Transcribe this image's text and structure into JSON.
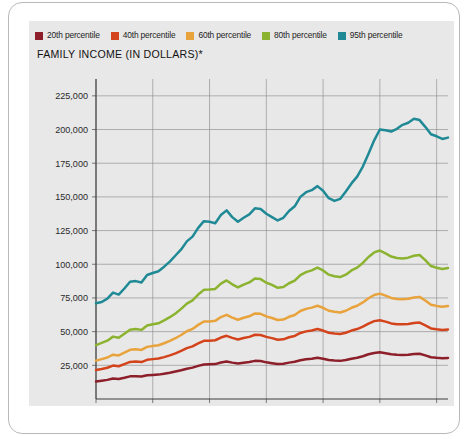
{
  "figure": {
    "title": "FAMILY INCOME (IN DOLLARS)*"
  },
  "legend": {
    "position": "top",
    "items": [
      {
        "label": "20th percentile",
        "color": "#8c1f2a",
        "icon": "legend-swatch-icon"
      },
      {
        "label": "40th percentile",
        "color": "#d4441c",
        "icon": "legend-swatch-icon"
      },
      {
        "label": "60th percentile",
        "color": "#e8a33d",
        "icon": "legend-swatch-icon"
      },
      {
        "label": "80th percentile",
        "color": "#8cb330",
        "icon": "legend-swatch-icon"
      },
      {
        "label": "95th percentile",
        "color": "#1f8a96",
        "icon": "legend-swatch-icon"
      }
    ]
  },
  "axes": {
    "y_ticks": [
      "225,000",
      "200,000",
      "175,000",
      "150,000",
      "125,000",
      "100,000",
      "75,000",
      "50,000",
      "25,000"
    ],
    "x_ticks": [
      "1950",
      "1960",
      "1970",
      "1980",
      "1990",
      "2000",
      "2010"
    ]
  },
  "chart_data": {
    "type": "line",
    "title": "FAMILY INCOME (IN DOLLARS)*",
    "xlabel": "",
    "ylabel": "",
    "xlim": [
      1950,
      2012
    ],
    "ylim": [
      0,
      237500
    ],
    "grid": true,
    "legend_position": "top",
    "x": [
      1950,
      1951,
      1952,
      1953,
      1954,
      1955,
      1956,
      1957,
      1958,
      1959,
      1960,
      1961,
      1962,
      1963,
      1964,
      1965,
      1966,
      1967,
      1968,
      1969,
      1970,
      1971,
      1972,
      1973,
      1974,
      1975,
      1976,
      1977,
      1978,
      1979,
      1980,
      1981,
      1982,
      1983,
      1984,
      1985,
      1986,
      1987,
      1988,
      1989,
      1990,
      1991,
      1992,
      1993,
      1994,
      1995,
      1996,
      1997,
      1998,
      1999,
      2000,
      2001,
      2002,
      2003,
      2004,
      2005,
      2006,
      2007,
      2008,
      2009,
      2010,
      2011,
      2012
    ],
    "series": [
      {
        "name": "20th percentile",
        "color": "#8c1f2a",
        "values": [
          13000,
          13600,
          14200,
          15200,
          14900,
          15800,
          16800,
          16900,
          16700,
          17600,
          17900,
          18100,
          18800,
          19500,
          20400,
          21400,
          22500,
          23300,
          24600,
          25600,
          25800,
          25900,
          27100,
          27900,
          27000,
          26300,
          26900,
          27400,
          28300,
          28200,
          27200,
          26600,
          26000,
          26200,
          27000,
          27600,
          28800,
          29500,
          29900,
          30600,
          29900,
          28900,
          28500,
          28300,
          28900,
          29900,
          30600,
          31700,
          33200,
          34200,
          34700,
          34000,
          33200,
          32800,
          32700,
          32900,
          33400,
          33600,
          32400,
          31000,
          30600,
          30300,
          30500
        ]
      },
      {
        "name": "40th percentile",
        "color": "#d4441c",
        "values": [
          21500,
          22300,
          23200,
          24800,
          24300,
          25900,
          27500,
          27800,
          27400,
          29100,
          29600,
          30000,
          31100,
          32400,
          33900,
          35700,
          37800,
          39100,
          41300,
          43200,
          43300,
          43600,
          45600,
          46900,
          45400,
          44200,
          45300,
          46100,
          47700,
          47500,
          46100,
          45200,
          44000,
          44300,
          45800,
          46800,
          49000,
          50200,
          50900,
          51900,
          50800,
          49200,
          48600,
          48200,
          49200,
          50800,
          51900,
          53700,
          56000,
          57800,
          58500,
          57400,
          56100,
          55500,
          55400,
          55700,
          56400,
          56700,
          54700,
          52400,
          51700,
          51200,
          51600
        ]
      },
      {
        "name": "60th percentile",
        "color": "#e8a33d",
        "values": [
          28500,
          29600,
          30800,
          32900,
          32300,
          34400,
          36500,
          36900,
          36400,
          38700,
          39400,
          39900,
          41400,
          43100,
          45100,
          47500,
          50300,
          52000,
          55000,
          57500,
          57600,
          58000,
          60800,
          62500,
          60400,
          58800,
          60300,
          61400,
          63500,
          63200,
          61300,
          60100,
          58600,
          59000,
          61000,
          62300,
          65300,
          66900,
          67800,
          69200,
          67700,
          65500,
          64700,
          64200,
          65500,
          67700,
          69200,
          71700,
          74800,
          77200,
          78200,
          76700,
          75000,
          74200,
          74000,
          74400,
          75400,
          75800,
          73100,
          70000,
          69100,
          68500,
          69000
        ]
      },
      {
        "name": "80th percentile",
        "color": "#8cb330",
        "values": [
          40000,
          41600,
          43300,
          46300,
          45400,
          48400,
          51400,
          52000,
          51300,
          54500,
          55500,
          56200,
          58300,
          60700,
          63500,
          66900,
          70800,
          73200,
          77500,
          81000,
          81200,
          81700,
          85600,
          88000,
          85100,
          82800,
          84900,
          86500,
          89500,
          89000,
          86300,
          84700,
          82500,
          83100,
          85900,
          87800,
          92000,
          94200,
          95500,
          97500,
          95400,
          92300,
          91100,
          90500,
          92300,
          95400,
          97500,
          101000,
          105400,
          108800,
          110200,
          108100,
          105700,
          104600,
          104300,
          104900,
          106300,
          106900,
          103100,
          98700,
          97400,
          96500,
          97200
        ]
      },
      {
        "name": "95th percentile",
        "color": "#1f8a96",
        "values": [
          71000,
          72000,
          74500,
          79000,
          77500,
          82000,
          87000,
          87500,
          86500,
          92000,
          93500,
          94800,
          98200,
          102000,
          106500,
          111000,
          117000,
          120500,
          127000,
          132000,
          131500,
          130500,
          136500,
          140000,
          135000,
          131500,
          134500,
          137000,
          141500,
          141000,
          137500,
          135000,
          132500,
          134500,
          139500,
          143000,
          150000,
          153500,
          155000,
          158000,
          154500,
          149000,
          147000,
          148500,
          154000,
          160000,
          165000,
          172500,
          182000,
          192000,
          200000,
          199500,
          198500,
          200500,
          203500,
          205000,
          208000,
          207000,
          202000,
          196500,
          195000,
          193000,
          194000
        ]
      }
    ]
  }
}
